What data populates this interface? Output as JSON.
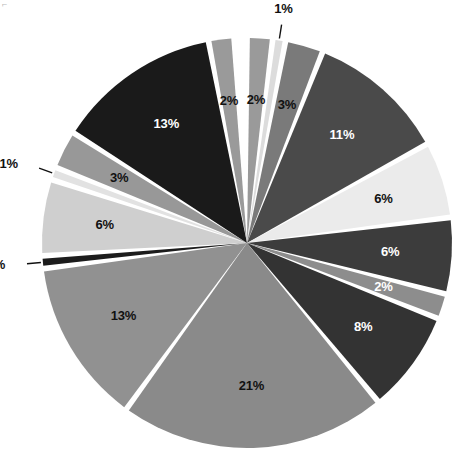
{
  "chart_data": {
    "type": "pie",
    "title": "",
    "subtitle": "",
    "xlabel": "",
    "ylabel": "",
    "legend_position": "none",
    "grid": false,
    "units": "percent",
    "start_angle_deg": 0,
    "direction": "clockwise",
    "center": {
      "x": 247,
      "y": 243
    },
    "radius": 205,
    "gap_deg": 1.6,
    "total": 100,
    "categories": [
      "Slice 1",
      "Slice 2",
      "Slice 3",
      "Slice 4",
      "Slice 5",
      "Slice 6",
      "Slice 7",
      "Slice 8",
      "Slice 9",
      "Slice 10",
      "Slice 11",
      "Slice 12",
      "Slice 13",
      "Slice 14",
      "Slice 15",
      "Slice 16"
    ],
    "values": [
      2,
      1,
      3,
      11,
      6,
      6,
      2,
      8,
      21,
      13,
      1,
      6,
      1,
      3,
      13,
      2
    ],
    "labels": [
      "2%",
      "1%",
      "3%",
      "11%",
      "6%",
      "6%",
      "2%",
      "8%",
      "21%",
      "13%",
      "1%",
      "6%",
      "1%",
      "3%",
      "13%",
      "2%"
    ],
    "colors": [
      "#9a9a9a",
      "#dcdcdc",
      "#7a7a7a",
      "#4a4a4a",
      "#ebebeb",
      "#3c3c3c",
      "#8d8d8d",
      "#333333",
      "#8a8a8a",
      "#919191",
      "#1c1c1c",
      "#cfcfcf",
      "#e2e2e2",
      "#989898",
      "#1a1a1a",
      "#9a9a9a"
    ],
    "label_placement": [
      "inside",
      "outside",
      "inside",
      "inside",
      "inside",
      "inside",
      "inside",
      "inside",
      "inside",
      "inside",
      "outside",
      "inside",
      "outside",
      "inside",
      "inside",
      "inside"
    ],
    "label_colors": [
      "dark",
      "dark",
      "dark",
      "light",
      "dark",
      "light",
      "light",
      "light",
      "dark",
      "dark",
      "dark",
      "dark",
      "dark",
      "dark",
      "light",
      "dark"
    ]
  },
  "marks": {
    "corner_tick": "⌐"
  }
}
